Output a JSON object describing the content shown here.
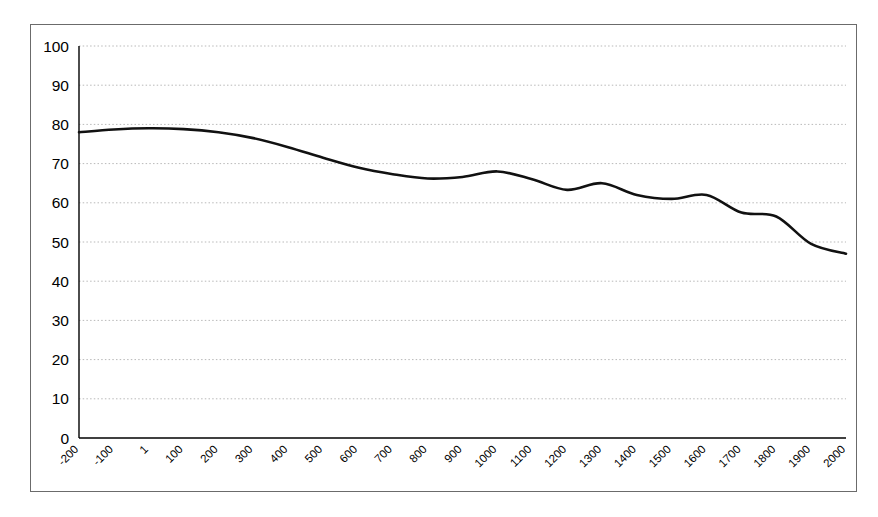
{
  "chart_data": {
    "type": "line",
    "title": "",
    "subtitle": "",
    "xlabel": "",
    "ylabel": "",
    "xlim": [
      -200,
      2000
    ],
    "ylim": [
      0,
      100
    ],
    "grid": true,
    "grid_axis": "y",
    "legend": "none",
    "line_color": "#111111",
    "tick_labels_x": [
      "-200",
      "-100",
      "1",
      "100",
      "200",
      "300",
      "400",
      "500",
      "600",
      "700",
      "800",
      "900",
      "1000",
      "1100",
      "1200",
      "1300",
      "1400",
      "1500",
      "1600",
      "1700",
      "1800",
      "1900",
      "2000"
    ],
    "tick_labels_y": [
      "0",
      "10",
      "20",
      "30",
      "40",
      "50",
      "60",
      "70",
      "80",
      "90",
      "100"
    ],
    "x": [
      -200,
      -100,
      1,
      100,
      200,
      300,
      400,
      500,
      600,
      700,
      800,
      900,
      1000,
      1100,
      1200,
      1300,
      1400,
      1500,
      1600,
      1700,
      1800,
      1900,
      2000
    ],
    "values": [
      78,
      78.7,
      79,
      78.8,
      78,
      76.5,
      74.2,
      71.5,
      69,
      67.3,
      66.2,
      66.6,
      68,
      66,
      63.3,
      65,
      62,
      61,
      62,
      57.5,
      56.5,
      49.5,
      47
    ],
    "series": [
      {
        "name": "series-1",
        "values": [
          78,
          78.7,
          79,
          78.8,
          78,
          76.5,
          74.2,
          71.5,
          69,
          67.3,
          66.2,
          66.6,
          68,
          66,
          63.3,
          65,
          62,
          61,
          62,
          57.5,
          56.5,
          49.5,
          47
        ]
      }
    ]
  },
  "figure": {
    "border_color": "#6b6b6b",
    "background": "#ffffff",
    "gridline_color": "#b9b9b9",
    "axis_color": "#000000"
  }
}
